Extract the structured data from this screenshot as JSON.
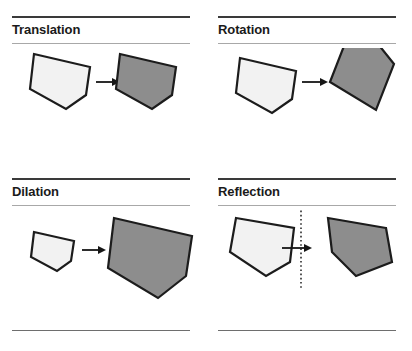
{
  "figure": {
    "background_color": "#ffffff",
    "layout": "2x2 grid of labeled transformation panels"
  },
  "colors": {
    "preimage_fill": "#f2f2f2",
    "image_fill": "#8d8d8d",
    "outline": "#1c1c1c",
    "rule_dark": "#3a3a3a",
    "rule_light": "#a8a8a8",
    "rule_foot": "#6e6e6e",
    "arrow": "#161616",
    "mirror_line": "#2b2b2b",
    "title_text": "#1a1a1a"
  },
  "panels": [
    {
      "id": "translation",
      "label": "Translation",
      "position": "top-left",
      "arrow_label": "maps to",
      "preimage_name": "light-pentagon-preimage",
      "image_name": "gray-pentagon-image",
      "has_mirror_line": false,
      "rules": {
        "top": true,
        "under_title": true,
        "foot": false
      }
    },
    {
      "id": "rotation",
      "label": "Rotation",
      "position": "top-right",
      "arrow_label": "maps to",
      "preimage_name": "light-pentagon-preimage",
      "image_name": "gray-pentagon-image",
      "has_mirror_line": false,
      "rules": {
        "top": true,
        "under_title": true,
        "foot": false
      }
    },
    {
      "id": "dilation",
      "label": "Dilation",
      "position": "bottom-left",
      "arrow_label": "maps to",
      "preimage_name": "light-pentagon-preimage",
      "image_name": "gray-pentagon-image",
      "has_mirror_line": false,
      "rules": {
        "top": true,
        "under_title": true,
        "foot": true
      }
    },
    {
      "id": "reflection",
      "label": "Reflection",
      "position": "bottom-right",
      "arrow_label": "maps to",
      "preimage_name": "light-pentagon-preimage",
      "image_name": "gray-pentagon-image",
      "has_mirror_line": true,
      "mirror_line_style": "vertical dotted line of reflection",
      "rules": {
        "top": true,
        "under_title": true,
        "foot": true
      }
    }
  ],
  "shapes": {
    "base_pentagon_points": "20,8 76,20 72,48 52,62 16,42",
    "translation": {
      "preimage_points": "22,6 78,19 74,47 54,61 18,41",
      "image_points": "108,6 164,19 160,47 140,61 104,41"
    },
    "rotation": {
      "preimage_points": "22,10 78,23 74,51 54,65 18,45",
      "image_points": "132,52 144,-4 172,0 186,20 166,56"
    },
    "dilation": {
      "preimage_points": "22,20 62,29 59,49 45,59 19,45",
      "image_points": "100,8 178,26 172,66 144,86 94,58"
    },
    "reflection": {
      "preimage_points": "18,6 76,16 72,50 48,64 12,40",
      "image_points": "166,16 108,6 112,40 136,64 172,50"
    }
  },
  "arrows": {
    "translation": {
      "x1": 84,
      "x2": 104,
      "y": 34
    },
    "rotation": {
      "x1": 84,
      "x2": 110,
      "y": 34
    },
    "dilation": {
      "x1": 72,
      "x2": 94,
      "y": 38
    },
    "reflection": {
      "x1": 64,
      "x2": 92,
      "y": 36
    }
  },
  "mirror": {
    "x": 83,
    "y1": -14,
    "y2": 78
  }
}
